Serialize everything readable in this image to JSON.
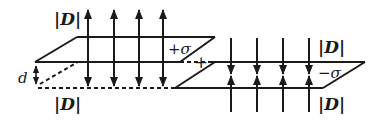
{
  "diagram": {
    "type": "parallel-plate field diagram",
    "labels": {
      "d_top_left": "|D|",
      "d_bottom_left": "|D|",
      "d_top_right": "|D|",
      "d_bottom_right": "|D|",
      "plus_sigma": "+σ",
      "minus_sigma": "−σ",
      "separation": "d",
      "plus_sign": "+"
    },
    "upper_plate": {
      "charge": "+σ",
      "field_direction": "outward (up and down)",
      "arrow_count": 4
    },
    "lower_plate": {
      "charge": "−σ",
      "field_direction": "inward (toward plate)",
      "arrow_count": 4
    },
    "colors": {
      "stroke": "#1a1a1a",
      "background": "#ffffff"
    }
  }
}
